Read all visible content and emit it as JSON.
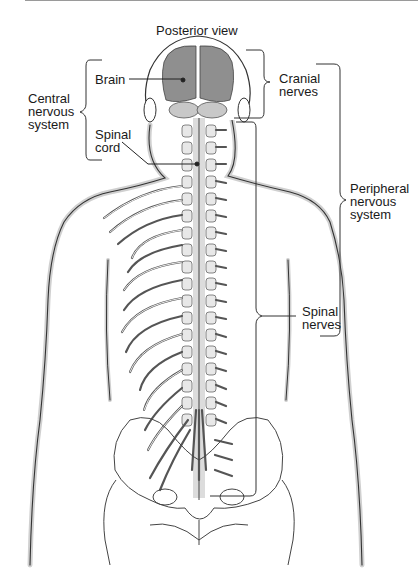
{
  "title": "Posterior view",
  "labels": {
    "brain": "Brain",
    "spinal_cord": "Spinal\ncord",
    "cns": "Central\nnervous\nsystem",
    "cranial_nerves": "Cranial\nnerves",
    "pns": "Peripheral\nnervous\nsystem",
    "spinal_nerves": "Spinal\nnerves"
  },
  "colors": {
    "brain_fill": "#8f8f8f",
    "cerebellum_fill": "#c8c8c8",
    "shadow": "#cfcfcf",
    "line": "#333333"
  }
}
